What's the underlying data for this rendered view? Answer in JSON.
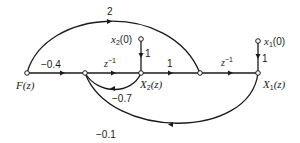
{
  "diagram": {
    "type": "signal-flow-graph",
    "nodes": {
      "F": {
        "label": "F(z)",
        "x": 27,
        "y": 73
      },
      "A": {
        "label": "",
        "x": 85,
        "y": 73
      },
      "X2": {
        "label": "X",
        "sub": "2",
        "arg": "(z)",
        "x": 141,
        "y": 73
      },
      "B": {
        "label": "",
        "x": 200,
        "y": 73
      },
      "X1": {
        "label": "X",
        "sub": "1",
        "arg": "(z)",
        "x": 258,
        "y": 73
      },
      "x2_0": {
        "label": "x",
        "sub": "2",
        "arg": "(0)",
        "x": 141,
        "y": 39
      },
      "x1_0": {
        "label": "x",
        "sub": "1",
        "arg": "(0)",
        "x": 258,
        "y": 41
      }
    },
    "edges": [
      {
        "from": "F",
        "to": "A",
        "gain": "−0.4"
      },
      {
        "from": "A",
        "to": "X2",
        "gain": "z",
        "exp": "−1"
      },
      {
        "from": "X2",
        "to": "B",
        "gain": "1"
      },
      {
        "from": "B",
        "to": "X1",
        "gain": "z",
        "exp": "−1"
      },
      {
        "from": "F",
        "to": "B",
        "gain": "2"
      },
      {
        "from": "X2",
        "to": "A",
        "gain": "−0.7"
      },
      {
        "from": "X1",
        "to": "A",
        "gain": "−0.1"
      },
      {
        "from": "x2_0",
        "to": "X2",
        "gain": "1"
      },
      {
        "from": "x1_0",
        "to": "X1",
        "gain": "1"
      }
    ]
  }
}
